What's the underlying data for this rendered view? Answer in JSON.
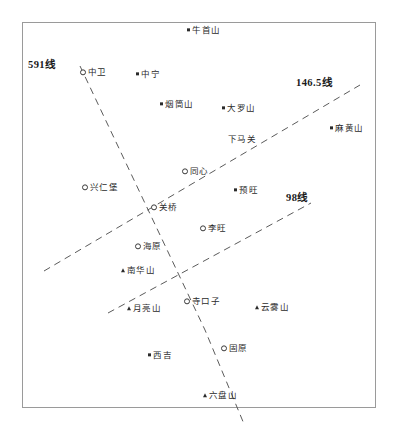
{
  "map": {
    "title": "宁夏地区测线分布图",
    "frame": {
      "x": 22,
      "y": 22,
      "width": 354,
      "height": 386,
      "border_color": "#9a9a9a"
    },
    "background_color": "#ffffff",
    "text_color": "#2b2b2b"
  },
  "line_labels": [
    {
      "text": "591线",
      "x": 28,
      "y": 60
    },
    {
      "text": "146.5线",
      "x": 296,
      "y": 78
    },
    {
      "text": "98线",
      "x": 286,
      "y": 193
    }
  ],
  "survey_lines": [
    {
      "name": "591线",
      "color": "#5b5b5b",
      "dash": "7,5",
      "points": [
        [
          80,
          66
        ],
        [
          205,
          330
        ],
        [
          244,
          424
        ]
      ]
    },
    {
      "name": "146.5线",
      "color": "#5b5b5b",
      "dash": "7,5",
      "points": [
        [
          44,
          271
        ],
        [
          360,
          85
        ]
      ]
    },
    {
      "name": "98线",
      "color": "#5b5b5b",
      "dash": "7,5",
      "points": [
        [
          108,
          313
        ],
        [
          311,
          203
        ]
      ]
    }
  ],
  "places": [
    {
      "name": "牛首山",
      "marker": "sq",
      "x": 187,
      "y": 30
    },
    {
      "name": "中卫",
      "marker": "circle",
      "x": 80,
      "y": 72
    },
    {
      "name": "中宁",
      "marker": "sq",
      "x": 136,
      "y": 74
    },
    {
      "name": "烟筒山",
      "marker": "sq",
      "x": 160,
      "y": 104
    },
    {
      "name": "大罗山",
      "marker": "sq",
      "x": 222,
      "y": 108
    },
    {
      "name": "麻黄山",
      "marker": "sq",
      "x": 330,
      "y": 128
    },
    {
      "name": "下马关",
      "marker": "none",
      "x": 228,
      "y": 139
    },
    {
      "name": "同心",
      "marker": "circle",
      "x": 182,
      "y": 171
    },
    {
      "name": "兴仁堡",
      "marker": "circle",
      "x": 82,
      "y": 187
    },
    {
      "name": "预旺",
      "marker": "sq",
      "x": 234,
      "y": 190
    },
    {
      "name": "关桥",
      "marker": "circle",
      "x": 151,
      "y": 207
    },
    {
      "name": "李旺",
      "marker": "circle",
      "x": 200,
      "y": 228
    },
    {
      "name": "海原",
      "marker": "circle",
      "x": 135,
      "y": 246
    },
    {
      "name": "南华山",
      "marker": "tri",
      "x": 121,
      "y": 270
    },
    {
      "name": "月亮山",
      "marker": "tri",
      "x": 127,
      "y": 308
    },
    {
      "name": "寺口子",
      "marker": "circle",
      "x": 184,
      "y": 301
    },
    {
      "name": "云雾山",
      "marker": "tri",
      "x": 255,
      "y": 307
    },
    {
      "name": "西吉",
      "marker": "sq",
      "x": 148,
      "y": 355
    },
    {
      "name": "固原",
      "marker": "circle",
      "x": 221,
      "y": 348
    },
    {
      "name": "六盘山",
      "marker": "tri",
      "x": 203,
      "y": 395
    }
  ]
}
